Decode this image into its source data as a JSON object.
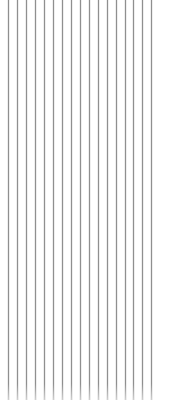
{
  "pattern": {
    "type": "vertical-lines",
    "line_color": "#8c8c8c",
    "background": "#ffffff",
    "x_positions": [
      8,
      17,
      26,
      35,
      44,
      53,
      62,
      71,
      80,
      89,
      98,
      107,
      116,
      125,
      133,
      142,
      151
    ],
    "line_height": 400
  }
}
